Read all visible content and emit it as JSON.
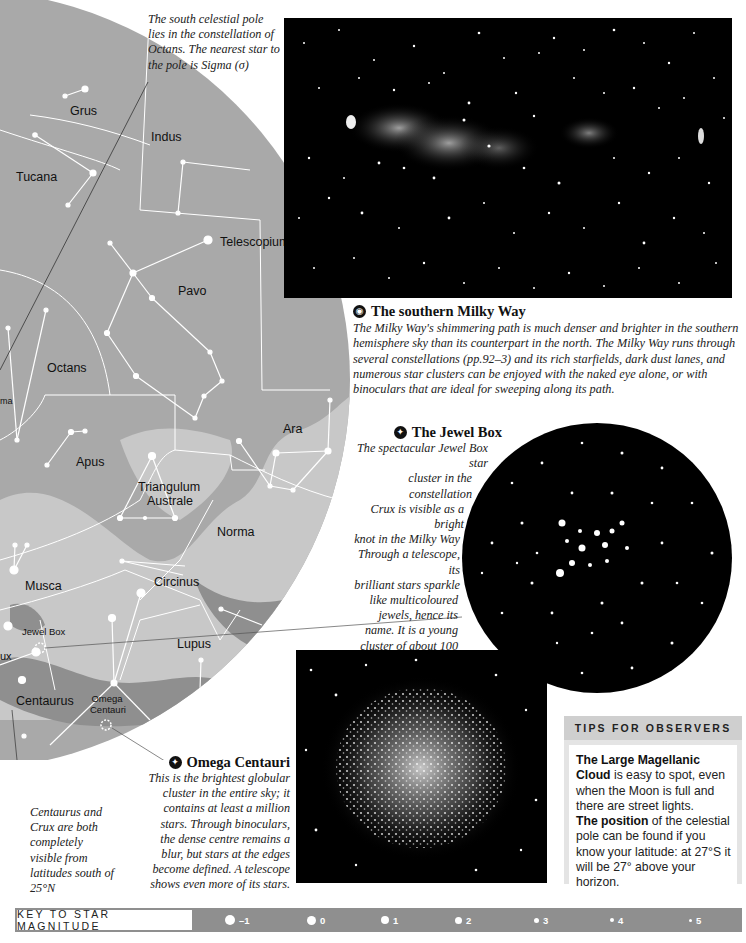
{
  "captions": {
    "pole_note": "The south celestial pole lies in the constellation of Octans. The nearest star to the pole is Sigma (σ)",
    "centaurus_note": "Centaurus and Crux are both completely visible from latitudes south of 25°N"
  },
  "map": {
    "constellations": [
      {
        "name": "Grus"
      },
      {
        "name": "Indus"
      },
      {
        "name": "Tucana"
      },
      {
        "name": "Telescopium"
      },
      {
        "name": "Pavo"
      },
      {
        "name": "Octans"
      },
      {
        "name": "Ara"
      },
      {
        "name": "Apus"
      },
      {
        "name": "Triangulum"
      },
      {
        "name": "Australe"
      },
      {
        "name": "Norma"
      },
      {
        "name": "Musca"
      },
      {
        "name": "Circinus"
      },
      {
        "name": "Lupus"
      },
      {
        "name": "Centaurus"
      },
      {
        "name": "ux"
      },
      {
        "name": "ma"
      }
    ],
    "objects": [
      {
        "name": "Jewel Box"
      },
      {
        "name": "Omega"
      },
      {
        "name": "Centauri"
      }
    ],
    "colors": {
      "sky": "#a8a8a8",
      "milky_way": "#c9c9c9",
      "dark": "#8d8d8d",
      "lines": "#ffffff"
    }
  },
  "milky_way": {
    "title": "The southern Milky Way",
    "icon": "eye-icon",
    "body": "The Milky Way's shimmering path is much denser and brighter in the southern hemisphere sky than its counterpart in the north. The Milky Way runs through several constellations (pp.92–3) and its rich starfields, dark dust lanes, and numerous star clusters can be enjoyed with the naked eye alone, or with binoculars that are ideal for sweeping along its path."
  },
  "jewel_box": {
    "title": "The Jewel Box",
    "icon": "telescope-icon",
    "lines": [
      "The spectacular Jewel Box star",
      "cluster in the constellation",
      "Crux is visible as a bright",
      "knot in the Milky Way",
      "Through a telescope, its",
      "brilliant stars sparkle",
      "like multicoloured",
      "jewels, hence its",
      "name. It is a young",
      "cluster of about 100",
      "stars, the brightest of",
      "which are mag.6"
    ]
  },
  "omega_centauri": {
    "title": "Omega Centauri",
    "icon": "telescope-icon",
    "lines": [
      "This is the brightest globular",
      "cluster in the entire sky; it",
      "contains at least a million",
      "stars. Through binoculars,",
      "the dense centre remains a",
      "blur, but stars at the edges",
      "become defined. A telescope",
      "shows even more of its stars."
    ]
  },
  "tips": {
    "heading": "TIPS FOR OBSERVERS",
    "p1_bold": "The Large Magellanic Cloud",
    "p1_rest": " is easy to spot, even when the Moon is full and there are street lights.",
    "p2_bold": "The position",
    "p2_rest": " of the celestial pole can be found if you know your latitude: at 27°S it will be 27° above your horizon."
  },
  "key": {
    "label": "KEY TO STAR MAGNITUDE",
    "magnitudes": [
      {
        "label": "–1",
        "size": 10
      },
      {
        "label": "0",
        "size": 9
      },
      {
        "label": "1",
        "size": 8
      },
      {
        "label": "2",
        "size": 7
      },
      {
        "label": "3",
        "size": 5
      },
      {
        "label": "4",
        "size": 4
      },
      {
        "label": "5",
        "size": 3
      }
    ]
  }
}
